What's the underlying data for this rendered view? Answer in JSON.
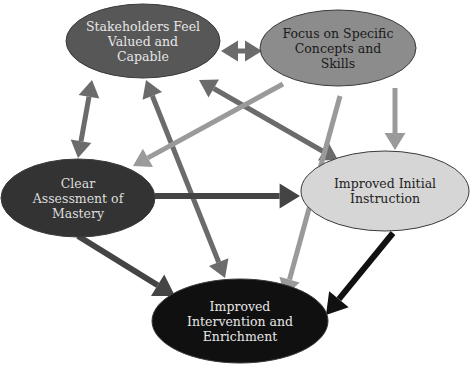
{
  "diagram": {
    "type": "cycle-network",
    "nodes": [
      {
        "id": "stakeholders",
        "label": "Stakeholders Feel\nValued and\nCapable",
        "fill": "#575757",
        "text_color": "#e6e6e6",
        "cx": 143,
        "cy": 41,
        "rx": 77,
        "ry": 37
      },
      {
        "id": "focus",
        "label": "Focus on Specific\nConcepts and\nSkills",
        "fill": "#8c8c8c",
        "text_color": "#1a1a1a",
        "cx": 338,
        "cy": 48,
        "rx": 78,
        "ry": 38
      },
      {
        "id": "assessment",
        "label": "Clear\nAssessment of\nMastery",
        "fill": "#333333",
        "text_color": "#dddddd",
        "cx": 78,
        "cy": 198,
        "rx": 77,
        "ry": 39
      },
      {
        "id": "instruction",
        "label": "Improved Initial\nInstruction",
        "fill": "#d6d6d6",
        "text_color": "#222222",
        "cx": 385,
        "cy": 191,
        "rx": 84,
        "ry": 40
      },
      {
        "id": "intervention",
        "label": "Improved\nIntervention and\nEnrichment",
        "fill": "#101010",
        "text_color": "#e6e6e6",
        "cx": 240,
        "cy": 321,
        "rx": 88,
        "ry": 42
      }
    ],
    "edges": [
      {
        "from": "stakeholders",
        "to": "focus",
        "bidirectional": true,
        "color": "#6b6b6b",
        "x1": 221,
        "y1": 51,
        "x2": 262,
        "y2": 51,
        "width": 5
      },
      {
        "from": "stakeholders",
        "to": "assessment",
        "bidirectional": true,
        "color": "#6b6b6b",
        "x1": 92,
        "y1": 80,
        "x2": 78,
        "y2": 158,
        "width": 5
      },
      {
        "from": "stakeholders",
        "to": "intervention",
        "bidirectional": true,
        "color": "#6b6b6b",
        "x1": 146,
        "y1": 80,
        "x2": 225,
        "y2": 278,
        "width": 5
      },
      {
        "from": "stakeholders",
        "to": "instruction",
        "bidirectional": true,
        "color": "#6b6b6b",
        "x1": 199,
        "y1": 80,
        "x2": 338,
        "y2": 160,
        "width": 5
      },
      {
        "from": "focus",
        "to": "assessment",
        "bidirectional": false,
        "color": "#9a9a9a",
        "x1": 283,
        "y1": 84,
        "x2": 133,
        "y2": 166,
        "width": 5
      },
      {
        "from": "focus",
        "to": "instruction",
        "bidirectional": false,
        "color": "#9a9a9a",
        "x1": 395,
        "y1": 88,
        "x2": 395,
        "y2": 150,
        "width": 5
      },
      {
        "from": "focus",
        "to": "intervention",
        "bidirectional": false,
        "color": "#9a9a9a",
        "x1": 340,
        "y1": 96,
        "x2": 285,
        "y2": 296,
        "width": 5
      },
      {
        "from": "assessment",
        "to": "instruction",
        "bidirectional": false,
        "color": "#444444",
        "x1": 155,
        "y1": 196,
        "x2": 300,
        "y2": 196,
        "width": 6
      },
      {
        "from": "assessment",
        "to": "intervention",
        "bidirectional": false,
        "color": "#444444",
        "x1": 78,
        "y1": 236,
        "x2": 175,
        "y2": 296,
        "width": 6
      },
      {
        "from": "instruction",
        "to": "intervention",
        "bidirectional": false,
        "color": "#111111",
        "x1": 393,
        "y1": 233,
        "x2": 326,
        "y2": 315,
        "width": 6
      }
    ]
  }
}
